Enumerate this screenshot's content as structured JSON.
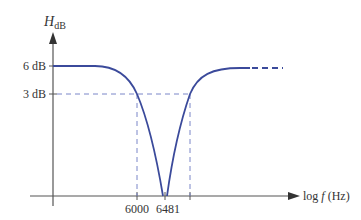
{
  "diagram": {
    "type": "frequency_response_notch_filter",
    "y_axis": {
      "label_main": "H",
      "label_sub": "dB",
      "ticks": [
        {
          "label": "6 dB",
          "y": 66
        },
        {
          "label": "3 dB",
          "y": 94
        }
      ]
    },
    "x_axis": {
      "label": "log f (Hz)",
      "label_log": "log ",
      "label_f": "f",
      "label_unit": " (Hz)",
      "ticks": [
        {
          "label": "6000",
          "x": 137
        },
        {
          "label": "6481",
          "x": 165
        }
      ]
    },
    "colors": {
      "curve": "#3b4a9b",
      "dashed": "#7a86c8",
      "axis": "#555555",
      "text": "#333333"
    },
    "annotations": {
      "cutoff_left_x": 137,
      "cutoff_right_x": 190,
      "center_x": 165
    }
  }
}
